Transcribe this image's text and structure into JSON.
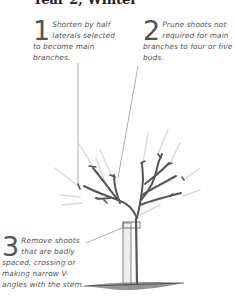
{
  "title": "Year 2, Winter",
  "notes": [
    {
      "number": "1",
      "text": "Shorten by half laterals selected to become main branches."
    },
    {
      "number": "2",
      "text": "Prune shoots not required for main branches to four or five buds."
    },
    {
      "number": "3",
      "text": "Remove shoots that are badly spaced, crossing or making narrow V-angles with the stem."
    }
  ],
  "colors": {
    "branch": "#555555",
    "pruned_shoot": "#d8d8d8",
    "text": "#555555",
    "leader_line": "#777777"
  },
  "illustration": "young-tree-with-stake-pruning-diagram"
}
